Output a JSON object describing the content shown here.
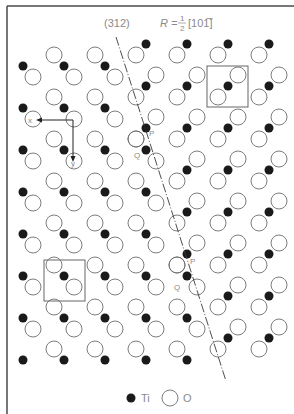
{
  "figure": {
    "plane_label": "(312)",
    "vector_label_prefix": "R = ",
    "vector_fraction_num": "1",
    "vector_fraction_den": "2",
    "vector_direction": "[101̅]",
    "point_labels": [
      {
        "text": "P",
        "x": 149,
        "y": 136
      },
      {
        "text": "Q",
        "x": 134,
        "y": 158
      },
      {
        "text": "P",
        "x": 190,
        "y": 264
      },
      {
        "text": "Q",
        "x": 174,
        "y": 290
      }
    ],
    "axis_labels": {
      "x": "x",
      "y": "y"
    },
    "legend": [
      {
        "symbol": "filled-circle",
        "label": "Ti"
      },
      {
        "symbol": "open-circle",
        "label": "O"
      }
    ]
  },
  "lattice": {
    "ti_columns": [
      23,
      64,
      105,
      146,
      187,
      228,
      269
    ],
    "left_domain_ti_rows": [
      66,
      108,
      150,
      192,
      234,
      276,
      318,
      360
    ],
    "right_domain_ti_rows": [
      44,
      86,
      128,
      170,
      212,
      254,
      296,
      338
    ],
    "left_motif_o_offsets": [
      [
        -10,
        -11
      ],
      [
        10,
        11
      ]
    ],
    "right_motif_o_offsets": [
      [
        10,
        -11
      ],
      [
        -10,
        11
      ]
    ],
    "boundary_line": {
      "x1": 116,
      "y1": 37,
      "x2": 226,
      "y2": 381
    },
    "unit_cells": [
      {
        "x": 44,
        "y": 260,
        "w": 41,
        "h": 41
      },
      {
        "x": 207,
        "y": 66,
        "w": 41,
        "h": 41
      }
    ]
  },
  "colors": {
    "ti": "#1a1a1a",
    "o_stroke": "#6e6e6e",
    "frame": "#4a4a4a",
    "line": "#3a3a3a",
    "label": "#8a8a8a"
  }
}
